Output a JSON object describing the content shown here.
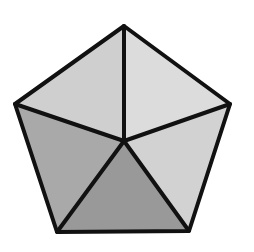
{
  "diagram": {
    "title": "",
    "shape": "regular pentagon divided into 5 triangles from center",
    "canvas": {
      "width": 254,
      "height": 252,
      "background": "#ffffff"
    },
    "stroke": {
      "color": "#111111",
      "width": 4
    },
    "vertices": {
      "top": [
        124,
        26
      ],
      "right": [
        230,
        104
      ],
      "bottom_right": [
        189,
        231
      ],
      "bottom_left": [
        57,
        232
      ],
      "left": [
        15,
        104
      ],
      "center": [
        124,
        141
      ]
    },
    "regions": [
      {
        "name": "top-left-triangle",
        "points": "124,26 15,104 124,141",
        "fill": "#cfcfcf"
      },
      {
        "name": "top-right-triangle",
        "points": "124,26 230,104 124,141",
        "fill": "#dcdcdc"
      },
      {
        "name": "right-triangle",
        "points": "230,104 189,231 124,141",
        "fill": "#d2d2d2"
      },
      {
        "name": "bottom-triangle",
        "points": "189,231 57,232 124,141",
        "fill": "#999999"
      },
      {
        "name": "left-triangle",
        "points": "57,232 15,104 124,141",
        "fill": "#a9a9a9"
      }
    ]
  }
}
